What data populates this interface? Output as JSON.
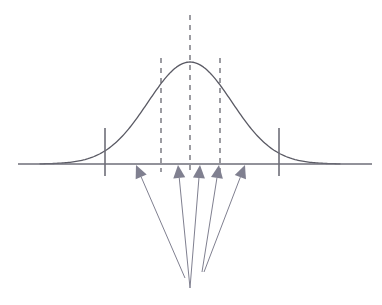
{
  "diagram": {
    "type": "statistical-illustration",
    "canvas": {
      "width": 382,
      "height": 305,
      "background": "#ffffff"
    },
    "colors": {
      "curve": "#5a5a64",
      "axis": "#6e6e78",
      "tick": "#6e6e78",
      "dashed": "#5a5a64",
      "arrow": "#808090",
      "arrow_head": "#808090"
    },
    "axis": {
      "label": "horizontal-axis",
      "x_start": 18,
      "x_end": 372,
      "y": 164,
      "stroke_width": 1.4
    },
    "curve": {
      "label": "bell-curve",
      "peak_x": 190,
      "peak_y": 62,
      "baseline_y": 164,
      "left_tail_x": 40,
      "right_tail_x": 340,
      "sigma_px": 42,
      "stroke_width": 1.3
    },
    "ticks": [
      {
        "name": "tick-left-boundary",
        "x": 105,
        "y_top": 128,
        "y_bottom": 176
      },
      {
        "name": "tick-right-boundary",
        "x": 279,
        "y_top": 128,
        "y_bottom": 176
      }
    ],
    "dashed_lines": [
      {
        "name": "dashed-line-left-sigma",
        "x": 161,
        "y_top": 58,
        "y_bottom": 172
      },
      {
        "name": "dashed-line-mean",
        "x": 190,
        "y_top": 15,
        "y_bottom": 172
      },
      {
        "name": "dashed-line-right-sigma",
        "x": 220,
        "y_top": 58,
        "y_bottom": 172
      }
    ],
    "pointer_arrows": [
      {
        "name": "pointer-arrow-1",
        "tip_x": 136,
        "tip_y": 165,
        "tail_x": 185,
        "tail_y": 278
      },
      {
        "name": "pointer-arrow-2",
        "tip_x": 178,
        "tip_y": 165,
        "tail_x": 190,
        "tail_y": 288
      },
      {
        "name": "pointer-arrow-3",
        "tip_x": 200,
        "tip_y": 165,
        "tail_x": 190,
        "tail_y": 288
      },
      {
        "name": "pointer-arrow-4",
        "tip_x": 219,
        "tip_y": 165,
        "tail_x": 202,
        "tail_y": 272
      },
      {
        "name": "pointer-arrow-5",
        "tip_x": 245,
        "tip_y": 165,
        "tail_x": 204,
        "tail_y": 272
      }
    ],
    "arrow_head": {
      "length": 13,
      "half_width": 6
    }
  }
}
